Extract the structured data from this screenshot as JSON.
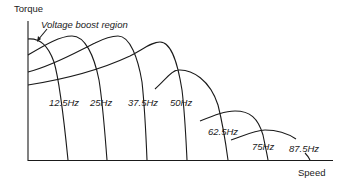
{
  "diagram": {
    "y_axis_label": "Torque",
    "x_axis_label": "Speed",
    "annotation": "Voltage boost region",
    "curves": [
      {
        "label": "12.5Hz"
      },
      {
        "label": "25Hz"
      },
      {
        "label": "37.5Hz"
      },
      {
        "label": "50Hz"
      },
      {
        "label": "62.5Hz"
      },
      {
        "label": "75Hz"
      },
      {
        "label": "87.5Hz"
      }
    ]
  }
}
